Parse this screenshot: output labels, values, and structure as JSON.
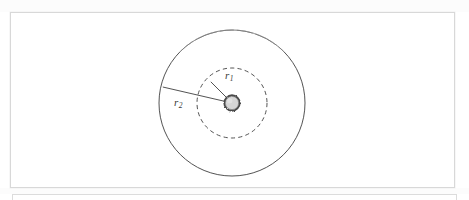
{
  "figure": {
    "type": "technical-diagram",
    "background_color": "#ffffff",
    "frame_color": "#d8d8d8",
    "labels": {
      "inner_radius": {
        "symbol": "r",
        "subscript": "1",
        "text": "r1"
      },
      "outer_radius": {
        "symbol": "r",
        "subscript": "2",
        "text": "r2"
      }
    },
    "geometry": {
      "center_x": 232,
      "center_y": 103,
      "outer_circle_radius": 73,
      "inner_circle_radius": 35,
      "hub_radius": 7
    },
    "styles": {
      "outer_circle": "solid",
      "inner_circle": "dashed",
      "hub_fill": "#d6d6d6",
      "hub_stroke": "#4a4a4a",
      "line_color": "#3f3f3f"
    }
  },
  "panels": {
    "main_panel_label": "figure-panel",
    "next_panel_label": "next-figure-panel"
  }
}
